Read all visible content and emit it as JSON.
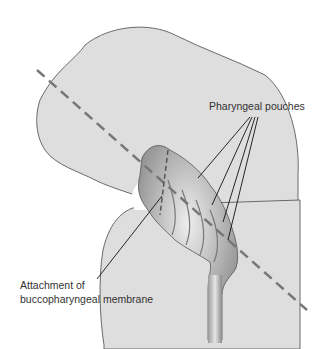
{
  "diagram": {
    "labels": {
      "pouches": "Pharyngeal pouches",
      "attachment_line1": "Attachment of",
      "attachment_line2": "buccopharyngeal membrane"
    },
    "colors": {
      "body_fill": "#dedede",
      "outline": "#6a6a6a",
      "dashed_line": "#777777",
      "gut_dark": "#8a8a8a",
      "leader": "#111111"
    }
  }
}
